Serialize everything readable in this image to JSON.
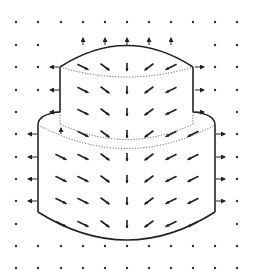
{
  "figure": {
    "colors": {
      "background": "#ffffff",
      "ink": "#222222",
      "dots": "#333333"
    },
    "grid": {
      "x": [
        16,
        38,
        61,
        83,
        105,
        127,
        149,
        171,
        193,
        215,
        237
      ],
      "y": [
        22,
        45,
        67,
        90,
        112,
        134,
        157,
        179,
        201,
        224,
        246,
        268
      ]
    },
    "upper_tier": {
      "left": 60,
      "right": 193,
      "top_edge_y": 52,
      "top_crown_y": 40,
      "bottom_y": 112,
      "bottom_dotted_dip_y": 82
    },
    "lower_tier": {
      "left": 38,
      "right": 215,
      "shoulder_y": 112,
      "side_top_y": 130,
      "bottom_side_y": 220,
      "bottom_curve_y": 243,
      "dotted_y1": 128,
      "dotted_dip1": 150,
      "dotted_dip2": 160
    },
    "arrows": [
      {
        "x": 83,
        "y": 45,
        "dx": 0,
        "dy": -7
      },
      {
        "x": 105,
        "y": 45,
        "dx": 0,
        "dy": -7
      },
      {
        "x": 127,
        "y": 45,
        "dx": 0,
        "dy": -7
      },
      {
        "x": 149,
        "y": 45,
        "dx": 0,
        "dy": -7
      },
      {
        "x": 171,
        "y": 45,
        "dx": 0,
        "dy": -7
      },
      {
        "x": 59,
        "y": 67,
        "dx": -9,
        "dy": 0
      },
      {
        "x": 195,
        "y": 67,
        "dx": 9,
        "dy": 0
      },
      {
        "x": 59,
        "y": 90,
        "dx": -9,
        "dy": 0
      },
      {
        "x": 195,
        "y": 90,
        "dx": 9,
        "dy": 0
      },
      {
        "x": 59,
        "y": 112,
        "dx": -9,
        "dy": 0
      },
      {
        "x": 195,
        "y": 112,
        "dx": 9,
        "dy": 0
      },
      {
        "x": 37,
        "y": 134,
        "dx": -9,
        "dy": 0
      },
      {
        "x": 216,
        "y": 134,
        "dx": 9,
        "dy": 0
      },
      {
        "x": 37,
        "y": 157,
        "dx": -9,
        "dy": 0
      },
      {
        "x": 216,
        "y": 157,
        "dx": 9,
        "dy": 0
      },
      {
        "x": 37,
        "y": 179,
        "dx": -9,
        "dy": 0
      },
      {
        "x": 216,
        "y": 179,
        "dx": 9,
        "dy": 0
      },
      {
        "x": 37,
        "y": 201,
        "dx": -9,
        "dy": 0
      },
      {
        "x": 216,
        "y": 201,
        "dx": 9,
        "dy": 0
      },
      {
        "x": 61,
        "y": 134,
        "dx": 0,
        "dy": -6
      }
    ],
    "interior": [
      {
        "row": 67,
        "cols": [
          83,
          105,
          127,
          149,
          171
        ]
      },
      {
        "row": 90,
        "cols": [
          83,
          105,
          127,
          149,
          171
        ]
      },
      {
        "row": 112,
        "cols": [
          83,
          105,
          127,
          149,
          171
        ]
      },
      {
        "row": 134,
        "cols": [
          83,
          105,
          127,
          149,
          171,
          193
        ]
      },
      {
        "row": 157,
        "cols": [
          61,
          83,
          105,
          127,
          149,
          171,
          193
        ]
      },
      {
        "row": 179,
        "cols": [
          61,
          83,
          105,
          127,
          149,
          171,
          193
        ]
      },
      {
        "row": 201,
        "cols": [
          61,
          83,
          105,
          127,
          149,
          171,
          193
        ]
      },
      {
        "row": 224,
        "cols": [
          61,
          83,
          105,
          127,
          149,
          171,
          193
        ]
      }
    ]
  }
}
